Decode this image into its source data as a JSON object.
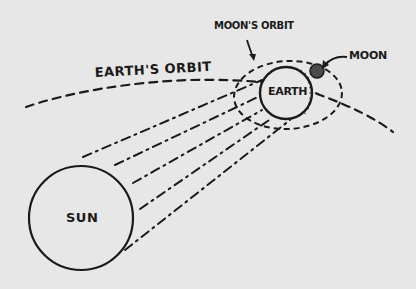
{
  "diagram": {
    "labels": {
      "earths_orbit": "EARTH'S ORBIT",
      "moons_orbit": "MOON'S ORBIT",
      "moon": "MOON",
      "earth": "EARTH",
      "sun": "SUN"
    },
    "colors": {
      "background": "#e7e7e7",
      "ink": "#1a1a1a",
      "moon_fill": "#4a4a4a"
    },
    "bodies": {
      "sun": {
        "cx": 81,
        "cy": 218,
        "r": 52
      },
      "earth": {
        "cx": 286,
        "cy": 93,
        "r": 26
      },
      "moon": {
        "cx": 317,
        "cy": 71,
        "r": 7
      }
    },
    "orbits": {
      "earth_orbit": "dashed arc from left edge curving up and across to the right past Earth",
      "moon_orbit": {
        "cx": 288,
        "cy": 95,
        "rx": 54,
        "ry": 34
      }
    },
    "sun_rays_count": 5
  }
}
